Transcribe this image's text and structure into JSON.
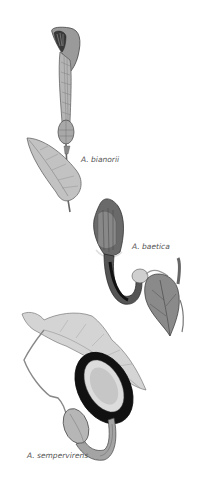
{
  "plate": {
    "title": "Aristolochia species illustration",
    "background": "#ffffff",
    "specimens": [
      {
        "label": "A. bianorii",
        "tone": "#8a8a8a"
      },
      {
        "label": "A. baetica",
        "tone": "#6e6e6e"
      },
      {
        "label": "A. sempervirens",
        "tone": "#1a1a1a"
      }
    ]
  }
}
